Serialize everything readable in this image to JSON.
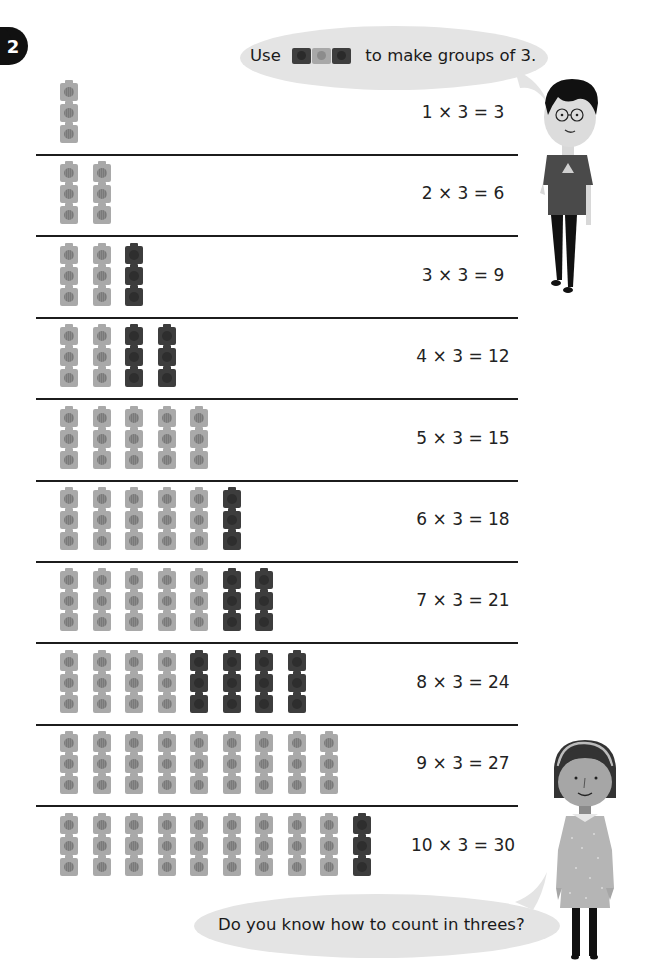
{
  "question_number": "2",
  "top_bubble": {
    "prefix": "Use",
    "icons": [
      "dark-cube",
      "light-cube",
      "dark-cube"
    ],
    "suffix": "to make groups of 3."
  },
  "bottom_bubble": {
    "text": "Do you know how to count in threes?"
  },
  "colors": {
    "light_cube": "#a9a9a9",
    "dark_cube": "#3d3d3d",
    "bubble": "#e4e4e4",
    "rule": "#1c1c1c"
  },
  "rows": [
    {
      "equation": "1 × 3 = 3",
      "groups": [
        "light"
      ]
    },
    {
      "equation": "2 × 3 = 6",
      "groups": [
        "light",
        "light"
      ]
    },
    {
      "equation": "3 × 3 = 9",
      "groups": [
        "light",
        "light",
        "dark"
      ]
    },
    {
      "equation": "4 × 3 = 12",
      "groups": [
        "light",
        "light",
        "dark",
        "dark"
      ]
    },
    {
      "equation": "5 × 3 = 15",
      "groups": [
        "light",
        "light",
        "light",
        "light",
        "light"
      ]
    },
    {
      "equation": "6 × 3 = 18",
      "groups": [
        "light",
        "light",
        "light",
        "light",
        "light",
        "dark"
      ]
    },
    {
      "equation": "7 × 3 = 21",
      "groups": [
        "light",
        "light",
        "light",
        "light",
        "light",
        "dark",
        "dark"
      ]
    },
    {
      "equation": "8 × 3 = 24",
      "groups": [
        "light",
        "light",
        "light",
        "light",
        "dark",
        "dark",
        "dark",
        "dark"
      ]
    },
    {
      "equation": "9 × 3 = 27",
      "groups": [
        "light",
        "light",
        "light",
        "light",
        "light",
        "light",
        "light",
        "light",
        "light"
      ]
    },
    {
      "equation": "10 × 3 = 30",
      "groups": [
        "light",
        "light",
        "light",
        "light",
        "light",
        "light",
        "light",
        "light",
        "light",
        "dark"
      ]
    }
  ],
  "characters": [
    {
      "name": "boy-with-glasses"
    },
    {
      "name": "girl-with-headband"
    }
  ]
}
